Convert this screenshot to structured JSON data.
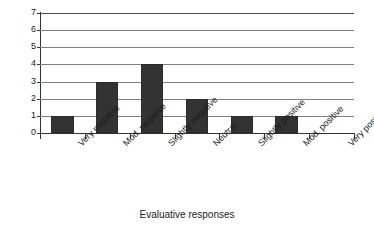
{
  "chart_data": {
    "type": "bar",
    "title": "",
    "subtitle": "",
    "xlabel": "Evaluative responses",
    "ylabel": "",
    "categories": [
      "Very negative",
      "Mod. negative",
      "Slightly negative",
      "Neutral",
      "Slightly positive",
      "Mod. positive",
      "Very positive"
    ],
    "values": [
      1,
      3,
      4,
      2,
      1,
      1,
      0
    ],
    "ylim": [
      0,
      7
    ],
    "ytick_labels": [
      "0",
      "1",
      "2",
      "3",
      "4",
      "5",
      "6",
      "7"
    ],
    "ytick_values": [
      0,
      1,
      2,
      3,
      4,
      5,
      6,
      7
    ],
    "grid": "horizontal",
    "legend": "none",
    "bar_color": "#333333",
    "gridline_color": "#808080",
    "axis_color": "#333333",
    "background_color": "#ffffff",
    "x_label_rotation": -45
  },
  "axis": {
    "x_title": "Evaluative responses"
  }
}
